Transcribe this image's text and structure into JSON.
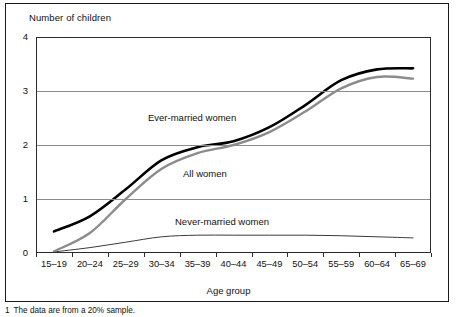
{
  "chart_data": {
    "type": "line",
    "title": "",
    "ylabel": "Number of children",
    "xlabel": "Age group",
    "ylim": [
      0,
      4
    ],
    "yticks": [
      "0",
      "1",
      "2",
      "3",
      "4"
    ],
    "grid": "horizontal",
    "legend_position": "inline-annotations",
    "categories": [
      "15–19",
      "20–24",
      "25–29",
      "30–34",
      "35–39",
      "40–44",
      "45–49",
      "50–54",
      "55–59",
      "60–64",
      "65–69"
    ],
    "series": [
      {
        "name": "Ever-married women",
        "color": "#000000",
        "width": 2.6,
        "values": [
          0.4,
          0.68,
          1.18,
          1.72,
          1.96,
          2.07,
          2.33,
          2.74,
          3.2,
          3.4,
          3.42
        ]
      },
      {
        "name": "All women",
        "color": "#8c8c8c",
        "width": 2.4,
        "values": [
          0.03,
          0.37,
          1.0,
          1.56,
          1.85,
          2.0,
          2.24,
          2.62,
          3.05,
          3.26,
          3.23
        ]
      },
      {
        "name": "Never-married women",
        "color": "#3a3a3a",
        "width": 1.0,
        "values": [
          0.02,
          0.1,
          0.2,
          0.3,
          0.33,
          0.33,
          0.33,
          0.33,
          0.32,
          0.3,
          0.28
        ]
      }
    ],
    "annotations": [
      {
        "text": "Ever-married women"
      },
      {
        "text": "All women"
      },
      {
        "text": "Never-married women"
      }
    ]
  },
  "footnote": {
    "mark": "1",
    "text": "The data are from a 20% sample."
  }
}
